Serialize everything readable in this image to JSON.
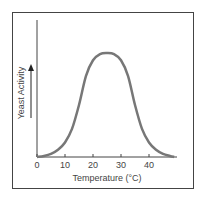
{
  "chart_data": {
    "type": "line",
    "title": "",
    "xlabel": "Temperature (°C)",
    "ylabel": "Yeast Activity",
    "xlim": [
      0,
      50
    ],
    "ylim": [
      0,
      1
    ],
    "xticks": [
      0,
      10,
      20,
      30,
      40
    ],
    "xtick_labels": [
      "0",
      "10",
      "20",
      "30",
      "40"
    ],
    "yticks": [],
    "grid": false,
    "legend": "none",
    "series": [
      {
        "name": "Yeast Activity",
        "x": [
          0,
          2.5,
          5,
          7.5,
          10,
          12.5,
          15,
          17.5,
          20,
          22.5,
          25,
          27.5,
          30,
          32.5,
          35,
          37.5,
          40,
          42.5,
          45,
          47.5,
          49
        ],
        "y": [
          0,
          0.01,
          0.03,
          0.07,
          0.14,
          0.27,
          0.5,
          0.78,
          0.93,
          0.99,
          1.0,
          0.99,
          0.93,
          0.78,
          0.5,
          0.27,
          0.14,
          0.07,
          0.03,
          0.01,
          0
        ],
        "color": "#777777"
      }
    ],
    "annotations": [
      {
        "text": "arrow-up",
        "meaning": "increasing activity"
      }
    ]
  }
}
